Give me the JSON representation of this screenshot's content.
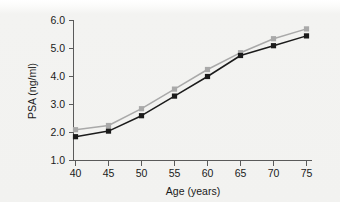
{
  "chart_data": {
    "type": "line",
    "title": "",
    "subtitle": "",
    "xlabel": "Age (years)",
    "ylabel": "PSA (ng/ml)",
    "x": [
      40,
      45,
      50,
      55,
      60,
      65,
      70,
      75
    ],
    "xtick_labels": [
      "40",
      "45",
      "50",
      "55",
      "60",
      "65",
      "70",
      "75"
    ],
    "ytick_labels": [
      "1.0",
      "2.0",
      "3.0",
      "4.0",
      "5.0",
      "6.0"
    ],
    "ytick_values": [
      1.0,
      2.0,
      3.0,
      4.0,
      5.0,
      6.0
    ],
    "xlim": [
      40,
      75
    ],
    "ylim": [
      1.0,
      6.0
    ],
    "grid": false,
    "legend": false,
    "legend_position": "none",
    "markers": "square",
    "series": [
      {
        "name": "upper",
        "color": "#a9a9a9",
        "values": [
          2.1,
          2.25,
          2.85,
          3.55,
          4.25,
          4.85,
          5.35,
          5.7
        ]
      },
      {
        "name": "lower",
        "color": "#1b1b1b",
        "values": [
          1.85,
          2.05,
          2.6,
          3.3,
          4.0,
          4.75,
          5.1,
          5.45
        ]
      }
    ]
  },
  "figure": {
    "background_color": "#f2f2f0",
    "axis_color": "#5a5a5a",
    "text_color": "#1a1a1a"
  }
}
